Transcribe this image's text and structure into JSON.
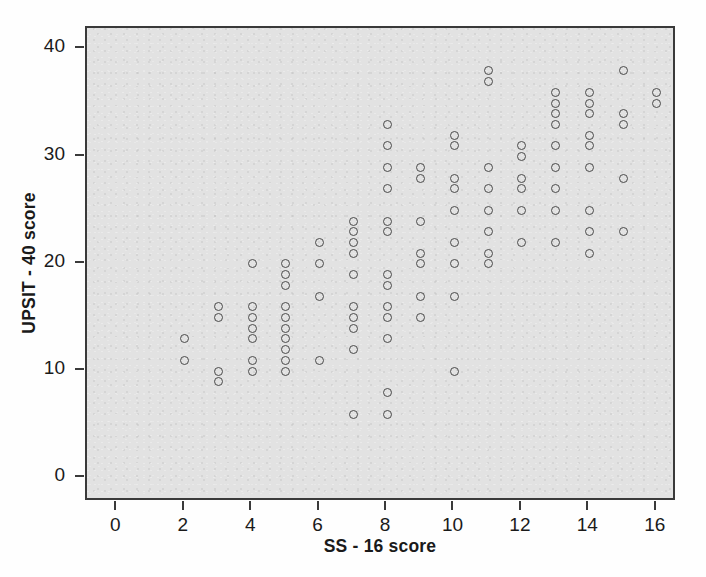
{
  "chart_data": {
    "type": "scatter",
    "title": "",
    "xlabel": "SS - 16 score",
    "ylabel": "UPSIT - 40 score",
    "xlim": [
      -0.9,
      16.6
    ],
    "ylim": [
      -2.2,
      42.0
    ],
    "xticks": [
      0,
      2,
      4,
      6,
      8,
      10,
      12,
      14,
      16
    ],
    "yticks": [
      0,
      10,
      20,
      30,
      40
    ],
    "xtick_labels": [
      "0",
      "2",
      "4",
      "6",
      "8",
      "10",
      "12",
      "14",
      "16"
    ],
    "ytick_labels": [
      "0",
      "10",
      "20",
      "30",
      "40"
    ],
    "grid": false,
    "legend": null,
    "marker": "open-circle",
    "marker_color": "#4a4a4a",
    "plot_background": "#e2e2e2",
    "points": [
      {
        "x": 2,
        "y": 13
      },
      {
        "x": 2,
        "y": 11
      },
      {
        "x": 3,
        "y": 16
      },
      {
        "x": 3,
        "y": 15
      },
      {
        "x": 3,
        "y": 10
      },
      {
        "x": 3,
        "y": 9
      },
      {
        "x": 4,
        "y": 20
      },
      {
        "x": 4,
        "y": 16
      },
      {
        "x": 4,
        "y": 15
      },
      {
        "x": 4,
        "y": 14
      },
      {
        "x": 4,
        "y": 13
      },
      {
        "x": 4,
        "y": 11
      },
      {
        "x": 4,
        "y": 10
      },
      {
        "x": 5,
        "y": 20
      },
      {
        "x": 5,
        "y": 19
      },
      {
        "x": 5,
        "y": 18
      },
      {
        "x": 5,
        "y": 16
      },
      {
        "x": 5,
        "y": 15
      },
      {
        "x": 5,
        "y": 14
      },
      {
        "x": 5,
        "y": 13
      },
      {
        "x": 5,
        "y": 12
      },
      {
        "x": 5,
        "y": 11
      },
      {
        "x": 5,
        "y": 10
      },
      {
        "x": 6,
        "y": 22
      },
      {
        "x": 6,
        "y": 20
      },
      {
        "x": 6,
        "y": 17
      },
      {
        "x": 6,
        "y": 11
      },
      {
        "x": 7,
        "y": 24
      },
      {
        "x": 7,
        "y": 23
      },
      {
        "x": 7,
        "y": 22
      },
      {
        "x": 7,
        "y": 21
      },
      {
        "x": 7,
        "y": 19
      },
      {
        "x": 7,
        "y": 16
      },
      {
        "x": 7,
        "y": 15
      },
      {
        "x": 7,
        "y": 14
      },
      {
        "x": 7,
        "y": 12
      },
      {
        "x": 7,
        "y": 6
      },
      {
        "x": 8,
        "y": 33
      },
      {
        "x": 8,
        "y": 31
      },
      {
        "x": 8,
        "y": 29
      },
      {
        "x": 8,
        "y": 27
      },
      {
        "x": 8,
        "y": 24
      },
      {
        "x": 8,
        "y": 23
      },
      {
        "x": 8,
        "y": 19
      },
      {
        "x": 8,
        "y": 18
      },
      {
        "x": 8,
        "y": 16
      },
      {
        "x": 8,
        "y": 15
      },
      {
        "x": 8,
        "y": 13
      },
      {
        "x": 8,
        "y": 8
      },
      {
        "x": 8,
        "y": 6
      },
      {
        "x": 9,
        "y": 29
      },
      {
        "x": 9,
        "y": 28
      },
      {
        "x": 9,
        "y": 24
      },
      {
        "x": 9,
        "y": 21
      },
      {
        "x": 9,
        "y": 20
      },
      {
        "x": 9,
        "y": 17
      },
      {
        "x": 9,
        "y": 15
      },
      {
        "x": 10,
        "y": 32
      },
      {
        "x": 10,
        "y": 31
      },
      {
        "x": 10,
        "y": 28
      },
      {
        "x": 10,
        "y": 27
      },
      {
        "x": 10,
        "y": 25
      },
      {
        "x": 10,
        "y": 22
      },
      {
        "x": 10,
        "y": 20
      },
      {
        "x": 10,
        "y": 17
      },
      {
        "x": 10,
        "y": 10
      },
      {
        "x": 11,
        "y": 38
      },
      {
        "x": 11,
        "y": 37
      },
      {
        "x": 11,
        "y": 29
      },
      {
        "x": 11,
        "y": 27
      },
      {
        "x": 11,
        "y": 25
      },
      {
        "x": 11,
        "y": 23
      },
      {
        "x": 11,
        "y": 21
      },
      {
        "x": 11,
        "y": 20
      },
      {
        "x": 12,
        "y": 31
      },
      {
        "x": 12,
        "y": 30
      },
      {
        "x": 12,
        "y": 28
      },
      {
        "x": 12,
        "y": 27
      },
      {
        "x": 12,
        "y": 25
      },
      {
        "x": 12,
        "y": 22
      },
      {
        "x": 13,
        "y": 36
      },
      {
        "x": 13,
        "y": 35
      },
      {
        "x": 13,
        "y": 34
      },
      {
        "x": 13,
        "y": 33
      },
      {
        "x": 13,
        "y": 31
      },
      {
        "x": 13,
        "y": 29
      },
      {
        "x": 13,
        "y": 27
      },
      {
        "x": 13,
        "y": 25
      },
      {
        "x": 13,
        "y": 22
      },
      {
        "x": 14,
        "y": 36
      },
      {
        "x": 14,
        "y": 35
      },
      {
        "x": 14,
        "y": 34
      },
      {
        "x": 14,
        "y": 32
      },
      {
        "x": 14,
        "y": 31
      },
      {
        "x": 14,
        "y": 29
      },
      {
        "x": 14,
        "y": 25
      },
      {
        "x": 14,
        "y": 23
      },
      {
        "x": 14,
        "y": 21
      },
      {
        "x": 15,
        "y": 38
      },
      {
        "x": 15,
        "y": 34
      },
      {
        "x": 15,
        "y": 33
      },
      {
        "x": 15,
        "y": 28
      },
      {
        "x": 15,
        "y": 23
      },
      {
        "x": 16,
        "y": 36
      },
      {
        "x": 16,
        "y": 35
      }
    ]
  }
}
